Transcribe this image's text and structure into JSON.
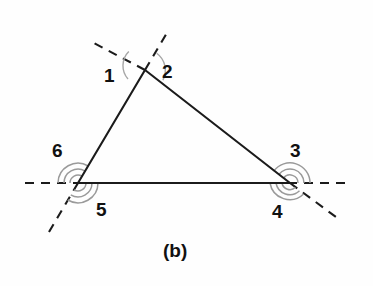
{
  "figure": {
    "caption": "(b)",
    "caption_position": {
      "x": 163,
      "y": 241
    },
    "background_color": "#fefefe",
    "line_color": "#1b1b1b",
    "arc_color": "#9a9a9a",
    "label_color": "#111111"
  },
  "geometry": {
    "description": "Triangle with each side extended as a dashed ray, forming exterior angles at every vertex",
    "vertices": {
      "apex": {
        "x": 145,
        "y": 70
      },
      "left": {
        "x": 78,
        "y": 183
      },
      "right": {
        "x": 290,
        "y": 183
      }
    },
    "triangle_sides": [
      {
        "name": "left-side",
        "from": "left",
        "to": "apex"
      },
      {
        "name": "right-side",
        "from": "apex",
        "to": "right"
      },
      {
        "name": "base",
        "from": "left",
        "to": "right"
      }
    ],
    "dashed_rays": [
      {
        "name": "base-extension-left",
        "x1": 25,
        "y1": 183,
        "x2": 78,
        "y2": 183
      },
      {
        "name": "base-extension-right",
        "x1": 290,
        "y1": 183,
        "x2": 351,
        "y2": 183
      },
      {
        "name": "left-side-extension-up",
        "x1": 145,
        "y1": 70,
        "x2": 168,
        "y2": 31
      },
      {
        "name": "right-side-extension-up",
        "x1": 145,
        "y1": 70,
        "x2": 90,
        "y2": 41
      },
      {
        "name": "left-side-extension-down",
        "x1": 78,
        "y1": 183,
        "x2": 49,
        "y2": 232
      },
      {
        "name": "right-side-extension-down",
        "x1": 290,
        "y1": 183,
        "x2": 336,
        "y2": 217
      }
    ]
  },
  "angles": [
    {
      "id": "1",
      "label": "1",
      "vertex": "apex",
      "arcs": 1,
      "label_x": 104,
      "label_y": 66
    },
    {
      "id": "2",
      "label": "2",
      "vertex": "apex",
      "arcs": 1,
      "label_x": 162,
      "label_y": 62
    },
    {
      "id": "3",
      "label": "3",
      "vertex": "right",
      "arcs": 3,
      "label_x": 290,
      "label_y": 141
    },
    {
      "id": "4",
      "label": "4",
      "vertex": "right",
      "arcs": 3,
      "label_x": 272,
      "label_y": 202
    },
    {
      "id": "5",
      "label": "5",
      "vertex": "left",
      "arcs": 3,
      "label_x": 96,
      "label_y": 200
    },
    {
      "id": "6",
      "label": "6",
      "vertex": "left",
      "arcs": 3,
      "label_x": 52,
      "label_y": 141
    }
  ]
}
